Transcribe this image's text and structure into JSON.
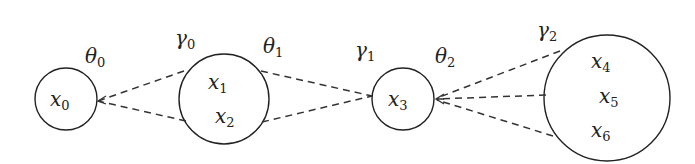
{
  "diagram": {
    "type": "graph",
    "nodes": [
      {
        "id": "n0",
        "cx": 66,
        "cy": 99,
        "r": 31,
        "labels": [
          {
            "base": "x",
            "sub": "0",
            "x": 50,
            "y": 106
          }
        ]
      },
      {
        "id": "n1",
        "cx": 224,
        "cy": 99,
        "r": 45,
        "labels": [
          {
            "base": "x",
            "sub": "1",
            "x": 208,
            "y": 89
          },
          {
            "base": "x",
            "sub": "2",
            "x": 215,
            "y": 123
          }
        ]
      },
      {
        "id": "n2",
        "cx": 403,
        "cy": 99,
        "r": 31,
        "labels": [
          {
            "base": "x",
            "sub": "3",
            "x": 388,
            "y": 106
          }
        ]
      },
      {
        "id": "n3",
        "cx": 607,
        "cy": 98,
        "r": 63,
        "labels": [
          {
            "base": "x",
            "sub": "4",
            "x": 591,
            "y": 68
          },
          {
            "base": "x",
            "sub": "5",
            "x": 599,
            "y": 103
          },
          {
            "base": "x",
            "sub": "6",
            "x": 591,
            "y": 137
          }
        ]
      }
    ],
    "edges": [
      {
        "from": "n1",
        "to": "n0",
        "x1": 184,
        "y1": 71,
        "x2": 98,
        "y2": 101
      },
      {
        "from": "n1",
        "to": "n0",
        "x1": 186,
        "y1": 121,
        "x2": 98,
        "y2": 101
      },
      {
        "from": "n1",
        "to": "n2",
        "x1": 261,
        "y1": 71,
        "x2": 372,
        "y2": 96
      },
      {
        "from": "n1",
        "to": "n2",
        "x1": 262,
        "y1": 122,
        "x2": 372,
        "y2": 96
      },
      {
        "from": "n3",
        "to": "n2",
        "x1": 560,
        "y1": 51,
        "x2": 436,
        "y2": 98
      },
      {
        "from": "n3",
        "to": "n2",
        "x1": 546,
        "y1": 95,
        "x2": 436,
        "y2": 99
      },
      {
        "from": "n3",
        "to": "n2",
        "x1": 553,
        "y1": 136,
        "x2": 436,
        "y2": 100
      }
    ],
    "params": [
      {
        "symbol": "θ",
        "sub": "0",
        "x": 85,
        "y": 63
      },
      {
        "symbol": "γ",
        "sub": "0",
        "x": 175,
        "y": 45
      },
      {
        "symbol": "θ",
        "sub": "1",
        "x": 263,
        "y": 53
      },
      {
        "symbol": "γ",
        "sub": "1",
        "x": 355,
        "y": 57
      },
      {
        "symbol": "θ",
        "sub": "2",
        "x": 435,
        "y": 63
      },
      {
        "symbol": "γ",
        "sub": "2",
        "x": 537,
        "y": 37
      }
    ]
  },
  "text": {
    "theta0": "θ",
    "theta0_sub": "0",
    "gamma0": "γ",
    "gamma0_sub": "0",
    "theta1": "θ",
    "theta1_sub": "1",
    "gamma1": "γ",
    "gamma1_sub": "1",
    "theta2": "θ",
    "theta2_sub": "2",
    "gamma2": "γ",
    "gamma2_sub": "2",
    "x": "x",
    "s0": "0",
    "s1": "1",
    "s2": "2",
    "s3": "3",
    "s4": "4",
    "s5": "5",
    "s6": "6"
  }
}
